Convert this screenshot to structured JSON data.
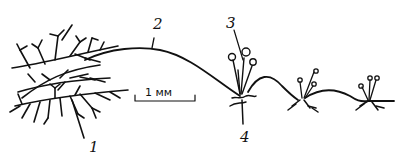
{
  "figure": {
    "type": "biological line drawing",
    "labels": [
      {
        "id": "1",
        "text": "1"
      },
      {
        "id": "2",
        "text": "2"
      },
      {
        "id": "3",
        "text": "3"
      },
      {
        "id": "4",
        "text": "4"
      }
    ],
    "scale_bar": {
      "text": "1 мм"
    },
    "colors": {
      "ink": "#111111",
      "background": "#ffffff"
    }
  }
}
